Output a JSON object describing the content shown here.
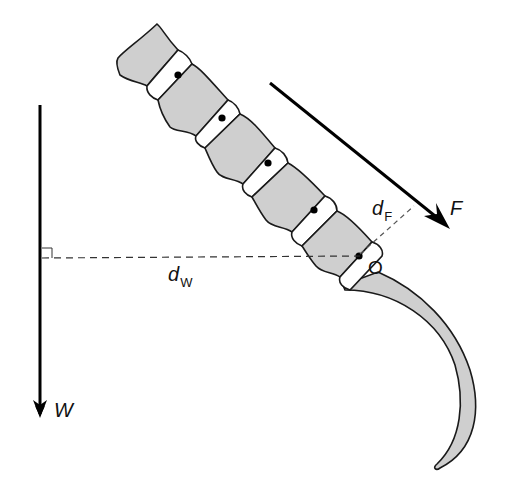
{
  "diagram": {
    "type": "biomechanics-lever",
    "labels": {
      "force_F": "F",
      "weight_W": "W",
      "moment_arm_F_base": "d",
      "moment_arm_F_sub": "F",
      "moment_arm_W_base": "d",
      "moment_arm_W_sub": "W",
      "pivot_O": "O"
    },
    "colors": {
      "bone_fill": "#cfcfcf",
      "disc_fill": "#ffffff",
      "outline": "#1a1a1a",
      "arrow": "#000000",
      "background": "#ffffff"
    },
    "elements": {
      "vertebrae_count": 5,
      "disc_count": 5,
      "joint_dots": 5,
      "claw": "curved hook-shaped bone at base",
      "weight_arrow": "vertical downward arrow on left",
      "force_arrow": "diagonal arrow pointing down-right",
      "right_angle_marker": "at junction of W line and dW dashed line"
    }
  }
}
